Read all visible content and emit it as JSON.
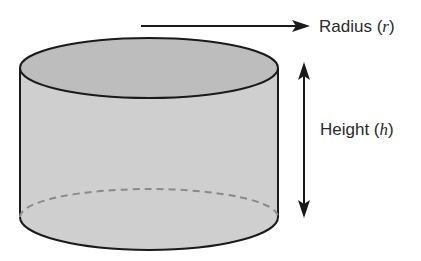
{
  "diagram": {
    "type": "cylinder-dimensions",
    "colors": {
      "top_face": "#bdbdbd",
      "side_face": "#cfcfcf",
      "outline": "#1a1a1a",
      "hidden_edge": "#8a8a8a",
      "arrow": "#1a1a1a",
      "text": "#2a2a2a"
    },
    "labels": {
      "radius": {
        "word": "Radius",
        "open": " (",
        "variable": "r",
        "close": ")"
      },
      "height": {
        "word": "Height",
        "open": " (",
        "variable": "h",
        "close": ")"
      }
    }
  }
}
